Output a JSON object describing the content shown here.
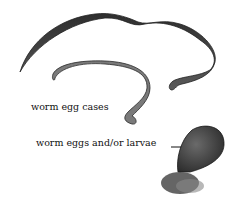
{
  "figure": {
    "labels": {
      "egg_cases": "worm egg cases",
      "eggs_larvae": "worm eggs and/or larvae"
    },
    "colors": {
      "background": "#ffffff",
      "worm_dark": "#3a3a3a",
      "worm_mid": "#6a6a6a",
      "text": "#111111"
    }
  }
}
